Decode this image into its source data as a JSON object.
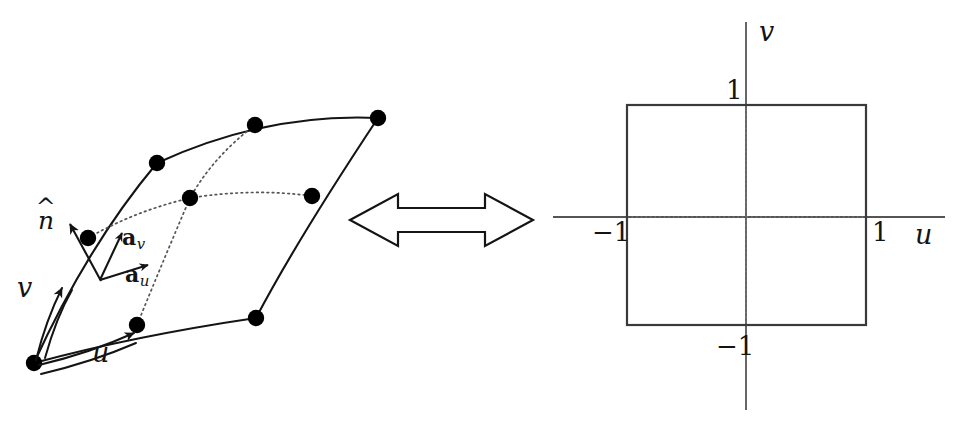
{
  "figure": {
    "background_color": "#ffffff",
    "stroke_color": "#141414",
    "node_color": "#000000",
    "dotted_color": "#555555"
  },
  "left_panel": {
    "name": "curved-surface-element",
    "node_count": 9,
    "labels": {
      "normal": "n",
      "normal_accent": "^",
      "tangent_v": "a",
      "tangent_v_sub": "v",
      "tangent_u": "a",
      "tangent_u_sub": "u",
      "axis_v": "v",
      "axis_u": "u"
    },
    "nodes": [
      {
        "id": "c1",
        "x": 34,
        "y": 363,
        "role": "corner"
      },
      {
        "id": "m1",
        "x": 137,
        "y": 325,
        "role": "mid-edge"
      },
      {
        "id": "c2",
        "x": 256,
        "y": 318,
        "role": "corner"
      },
      {
        "id": "m2",
        "x": 312,
        "y": 196,
        "role": "mid-edge"
      },
      {
        "id": "c3",
        "x": 378,
        "y": 118,
        "role": "corner"
      },
      {
        "id": "m3",
        "x": 255,
        "y": 125,
        "role": "mid-edge"
      },
      {
        "id": "c4",
        "x": 157,
        "y": 163,
        "role": "corner"
      },
      {
        "id": "m4",
        "x": 88,
        "y": 238,
        "role": "mid-edge"
      },
      {
        "id": "ctr",
        "x": 190,
        "y": 198,
        "role": "center"
      }
    ]
  },
  "connector": {
    "name": "double-headed-arrow",
    "direction": "bidirectional"
  },
  "right_panel": {
    "name": "reference-square",
    "axis_u_label": "u",
    "axis_v_label": "v",
    "ticks": {
      "u_min": "−1",
      "u_max": "1",
      "v_min": "−1",
      "v_max": "1"
    },
    "square": {
      "left": -1,
      "right": 1,
      "bottom": -1,
      "top": 1
    }
  }
}
